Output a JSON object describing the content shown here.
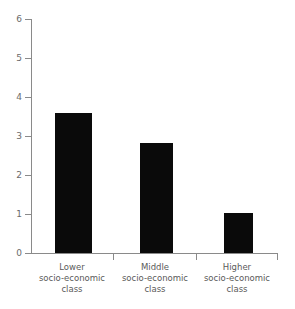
{
  "chart_data": {
    "type": "bar",
    "title": "",
    "subtitle": "",
    "xlabel": "",
    "ylabel": "",
    "categories": [
      "Lower socio-economic class",
      "Middle socio-economic class",
      "Higher socio-economic class"
    ],
    "category_lines": [
      [
        "Lower",
        "socio-economic",
        "class"
      ],
      [
        "Middle",
        "socio-economic",
        "class"
      ],
      [
        "Higher",
        "socio-economic",
        "class"
      ]
    ],
    "values": [
      3.6,
      2.82,
      1.02
    ],
    "ylim": [
      0,
      6
    ],
    "yticks": [
      0,
      1,
      2,
      3,
      4,
      5,
      6
    ],
    "ytick_labels": [
      "0",
      "1",
      "2",
      "3",
      "4",
      "5",
      "6"
    ],
    "grid": false,
    "legend": false,
    "legend_position": "none",
    "bar_color": "#0a0a0a",
    "axis_color": "#8a8a8a",
    "text_color": "#5a5a5a",
    "background": "#ffffff"
  }
}
